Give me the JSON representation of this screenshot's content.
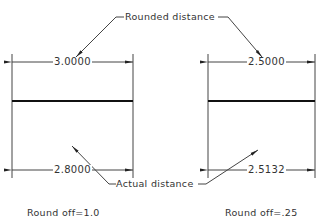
{
  "diagram": {
    "callouts": {
      "top": "Rounded distance",
      "bottom": "Actual distance"
    },
    "left": {
      "rounded_value": "3.0000",
      "actual_value": "2.8000",
      "caption": "Round off=1.0"
    },
    "right": {
      "rounded_value": "2.5000",
      "actual_value": "2.5132",
      "caption": "Round off=.25"
    }
  }
}
